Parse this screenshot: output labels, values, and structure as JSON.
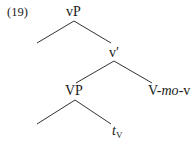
{
  "example": {
    "number": "(19)"
  },
  "tree": {
    "root": {
      "label": "vP"
    },
    "vbar": {
      "label": "v′"
    },
    "vp": {
      "label": "VP"
    },
    "head": {
      "pre": "V-",
      "italic": "mo",
      "post": "-v"
    },
    "trace": {
      "main": "t",
      "subscript": "V"
    },
    "edges": [
      {
        "from": "vP",
        "to": "empty-left-1"
      },
      {
        "from": "vP",
        "to": "v′"
      },
      {
        "from": "v′",
        "to": "VP"
      },
      {
        "from": "v′",
        "to": "V-mo-v"
      },
      {
        "from": "VP",
        "to": "empty-left-2"
      },
      {
        "from": "VP",
        "to": "tV"
      }
    ]
  }
}
